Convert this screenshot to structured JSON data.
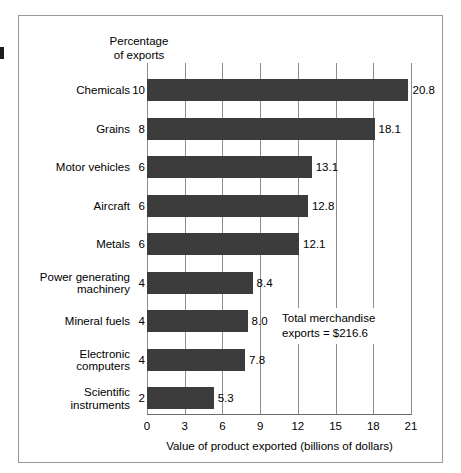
{
  "figure": {
    "header_note_line1": "Percentage",
    "header_note_line2": "of exports",
    "annotation_line1": "Total merchandise",
    "annotation_line2": "exports  =  $216.6",
    "bar_color": "#3c3c3c",
    "grid_color": "#8d8d8d",
    "frame_color": "#9a9a9a"
  },
  "chart_data": {
    "type": "bar",
    "orientation": "horizontal",
    "title": "",
    "xlabel": "Value of product exported (billions of dollars)",
    "ylabel": "",
    "xlim": [
      0,
      21
    ],
    "xticks": [
      0,
      3,
      6,
      9,
      12,
      15,
      18,
      21
    ],
    "xtick_labels": [
      "0",
      "3",
      "6",
      "9",
      "12",
      "15",
      "18",
      "21"
    ],
    "grid": true,
    "legend": "none",
    "secondary_axis_label_line1": "Percentage",
    "secondary_axis_label_line2": "of exports",
    "annotation": "Total merchandise exports  =  $216.6",
    "total_merchandise_exports": "216.6",
    "categories": [
      "Chemicals",
      "Grains",
      "Motor vehicles",
      "Aircraft",
      "Metals",
      "Power generating machinery",
      "Mineral fuels",
      "Electronic computers",
      "Scientific instruments"
    ],
    "values": [
      20.8,
      18.1,
      13.1,
      12.8,
      12.1,
      8.4,
      8.0,
      7.8,
      5.3
    ],
    "value_labels": [
      "20.8",
      "18.1",
      "13.1",
      "12.8",
      "12.1",
      "8.4",
      "8.0",
      "7.8",
      "5.3"
    ],
    "percent_of_exports": [
      10,
      8,
      6,
      6,
      6,
      4,
      4,
      4,
      2
    ],
    "percent_labels": [
      "10",
      "8",
      "6",
      "6",
      "6",
      "4",
      "4",
      "4",
      "2"
    ],
    "category_label_lines": [
      [
        "Chemicals"
      ],
      [
        "Grains"
      ],
      [
        "Motor vehicles"
      ],
      [
        "Aircraft"
      ],
      [
        "Metals"
      ],
      [
        "Power generating",
        "machinery"
      ],
      [
        "Mineral fuels"
      ],
      [
        "Electronic",
        "computers"
      ],
      [
        "Scientific",
        "instruments"
      ]
    ]
  }
}
